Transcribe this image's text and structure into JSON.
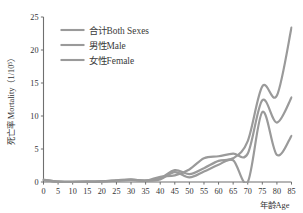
{
  "chart_data": {
    "type": "line",
    "title": "",
    "xlabel": "年龄Age",
    "ylabel": "死亡率 Mortality（1/10⁵）",
    "xlim": [
      0,
      85
    ],
    "ylim": [
      0,
      25
    ],
    "xticks": [
      0,
      5,
      10,
      15,
      20,
      25,
      30,
      35,
      40,
      45,
      50,
      55,
      60,
      65,
      70,
      75,
      80,
      85
    ],
    "yticks": [
      0,
      5,
      10,
      15,
      20,
      25
    ],
    "grid": false,
    "legend_position": "top-left",
    "x": [
      0,
      5,
      10,
      15,
      20,
      25,
      30,
      35,
      40,
      45,
      50,
      55,
      60,
      65,
      70,
      75,
      80,
      85
    ],
    "series": [
      {
        "name": "合计Both Sexes",
        "color": "#9a9a9a",
        "values": [
          0.35,
          0.05,
          0.04,
          0.05,
          0.1,
          0.2,
          0.35,
          0.2,
          0.55,
          1.8,
          1.2,
          2.1,
          3.2,
          3.6,
          6.2,
          14.5,
          13.1,
          23.4
        ]
      },
      {
        "name": "男性Male",
        "color": "#9a9a9a",
        "values": [
          0.3,
          0.05,
          0.04,
          0.05,
          0.1,
          0.25,
          0.4,
          0.2,
          0.8,
          1.0,
          1.9,
          3.6,
          3.9,
          4.3,
          4.3,
          12.4,
          9.0,
          12.8
        ]
      },
      {
        "name": "女性Female",
        "color": "#9a9a9a",
        "values": [
          0.3,
          0.05,
          0.04,
          0.05,
          0.1,
          0.2,
          0.3,
          0.2,
          0.4,
          1.5,
          0.7,
          1.6,
          2.6,
          3.3,
          0.0,
          10.6,
          4.1,
          7.0
        ]
      }
    ]
  },
  "legend": {
    "entries": [
      {
        "label": "合计Both Sexes"
      },
      {
        "label": "男性Male"
      },
      {
        "label": "女性Female"
      }
    ]
  }
}
